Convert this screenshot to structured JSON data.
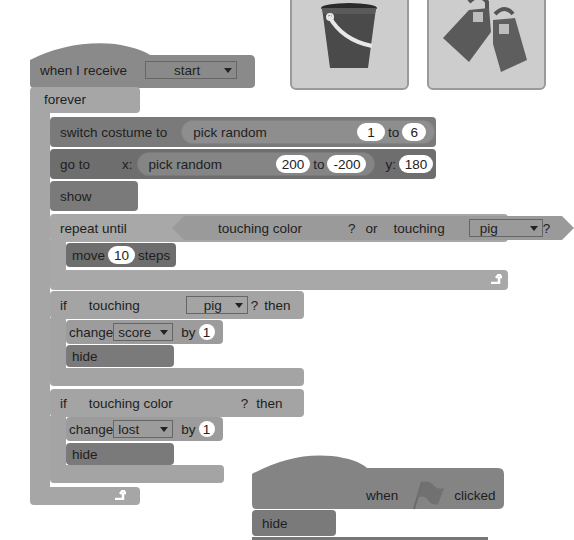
{
  "costumes": [
    {
      "name": "bucket",
      "icon": "bucket-icon"
    },
    {
      "name": "flippers",
      "icon": "flippers-icon"
    }
  ],
  "script1": {
    "hat": {
      "label": "when I receive",
      "message": "start"
    },
    "forever": {
      "label": "forever"
    },
    "switch_costume": {
      "label": "switch costume to",
      "reporter": "pick random",
      "from": "1",
      "to_label": "to",
      "to": "6"
    },
    "go_to": {
      "label": "go to",
      "x_label": "x:",
      "reporter": "pick random",
      "from": "200",
      "to_label": "to",
      "to": "-200",
      "y_label": "y:",
      "y": "180"
    },
    "show": {
      "label": "show"
    },
    "repeat_until": {
      "label": "repeat until",
      "cond_left": "touching color",
      "q1": "?",
      "or_label": "or",
      "cond_right": "touching",
      "sprite": "pig",
      "q2": "?",
      "move": {
        "label": "move",
        "steps": "10",
        "suffix": "steps"
      }
    },
    "if1": {
      "label": "if",
      "cond": "touching",
      "sprite": "pig",
      "q": "?",
      "then": "then",
      "change": {
        "label": "change",
        "var": "score",
        "by_label": "by",
        "value": "1"
      },
      "hide": "hide"
    },
    "if2": {
      "label": "if",
      "cond": "touching color",
      "q": "?",
      "then": "then",
      "change": {
        "label": "change",
        "var": "lost",
        "by_label": "by",
        "value": "1"
      },
      "hide": "hide"
    }
  },
  "script2": {
    "hat": {
      "when": "when",
      "clicked": "clicked",
      "icon": "green-flag-icon"
    },
    "hide": "hide"
  }
}
